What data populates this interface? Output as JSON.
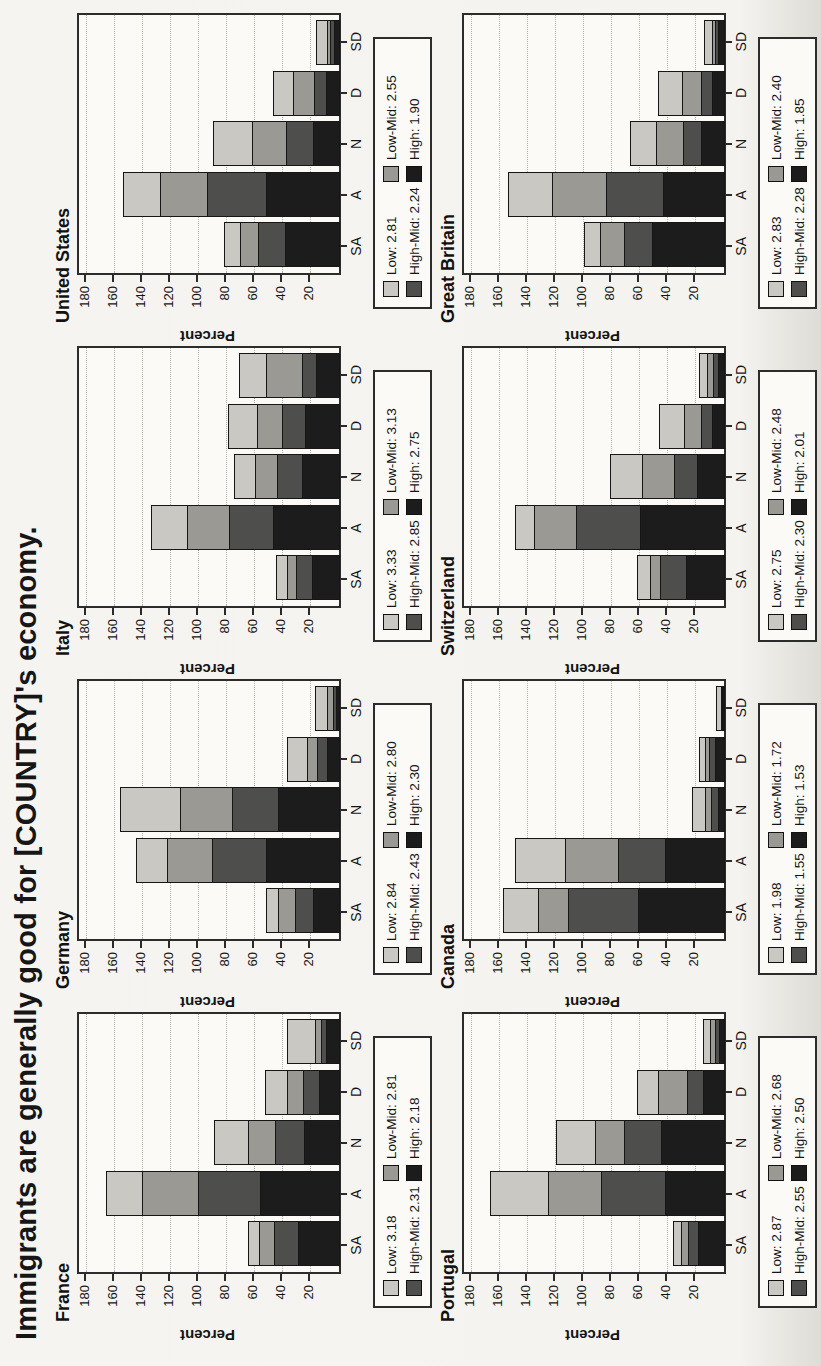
{
  "title": "Immigrants are generally good for [COUNTRY]'s economy.",
  "axis": {
    "ylabel": "Percent",
    "yticks": [
      20,
      40,
      60,
      80,
      100,
      120,
      140,
      160,
      180
    ],
    "ymax": 184,
    "categories": [
      "SA",
      "A",
      "N",
      "D",
      "SD"
    ]
  },
  "series_styles": [
    {
      "name": "Low",
      "color": "#c9c8c3"
    },
    {
      "name": "Low-Mid",
      "color": "#9a9994"
    },
    {
      "name": "High-Mid",
      "color": "#4e4e4c"
    },
    {
      "name": "High",
      "color": "#1c1c1c"
    }
  ],
  "chart_data": [
    {
      "type": "bar",
      "stacked": true,
      "title": "France",
      "categories": [
        "SA",
        "A",
        "N",
        "D",
        "SD"
      ],
      "ylabel": "Percent",
      "ylim": [
        0,
        184
      ],
      "grid": true,
      "legend_labels": [
        "Low: 3.18",
        "Low-Mid: 2.81",
        "High-Mid: 2.31",
        "High: 2.18"
      ],
      "legend_means": {
        "Low": 3.18,
        "Low-Mid": 2.81,
        "High-Mid": 2.31,
        "High": 2.18
      },
      "series": [
        {
          "name": "Low",
          "values": [
            9,
            26,
            25,
            17,
            21
          ]
        },
        {
          "name": "Low-Mid",
          "values": [
            11,
            41,
            20,
            12,
            5
          ]
        },
        {
          "name": "High-Mid",
          "values": [
            18,
            45,
            21,
            12,
            4
          ]
        },
        {
          "name": "High",
          "values": [
            30,
            57,
            26,
            15,
            10
          ]
        }
      ]
    },
    {
      "type": "bar",
      "stacked": true,
      "title": "Germany",
      "categories": [
        "SA",
        "A",
        "N",
        "D",
        "SD"
      ],
      "ylabel": "Percent",
      "ylim": [
        0,
        184
      ],
      "grid": true,
      "legend_labels": [
        "Low: 2.84",
        "Low-Mid: 2.80",
        "High-Mid: 2.43",
        "High: 2.30"
      ],
      "legend_means": {
        "Low": 2.84,
        "Low-Mid": 2.8,
        "High-Mid": 2.43,
        "High": 2.3
      },
      "series": [
        {
          "name": "Low",
          "values": [
            9,
            23,
            43,
            15,
            9
          ]
        },
        {
          "name": "Low-Mid",
          "values": [
            13,
            33,
            38,
            8,
            5
          ]
        },
        {
          "name": "High-Mid",
          "values": [
            14,
            39,
            34,
            8,
            3
          ]
        },
        {
          "name": "High",
          "values": [
            19,
            53,
            44,
            9,
            3
          ]
        }
      ]
    },
    {
      "type": "bar",
      "stacked": true,
      "title": "Italy",
      "categories": [
        "SA",
        "A",
        "N",
        "D",
        "SD"
      ],
      "ylabel": "Percent",
      "ylim": [
        0,
        184
      ],
      "grid": true,
      "legend_labels": [
        "Low: 3.33",
        "Low-Mid: 3.13",
        "High-Mid: 2.85",
        "High: 2.75"
      ],
      "legend_means": {
        "Low": 3.33,
        "Low-Mid": 3.13,
        "High-Mid": 2.85,
        "High": 2.75
      },
      "series": [
        {
          "name": "Low",
          "values": [
            9,
            26,
            16,
            21,
            20
          ]
        },
        {
          "name": "Low-Mid",
          "values": [
            7,
            31,
            16,
            19,
            26
          ]
        },
        {
          "name": "High-Mid",
          "values": [
            12,
            32,
            19,
            17,
            11
          ]
        },
        {
          "name": "High",
          "values": [
            20,
            48,
            27,
            25,
            17
          ]
        }
      ]
    },
    {
      "type": "bar",
      "stacked": true,
      "title": "United States",
      "categories": [
        "SA",
        "A",
        "N",
        "D",
        "SD"
      ],
      "ylabel": "Percent",
      "ylim": [
        0,
        184
      ],
      "grid": true,
      "legend_labels": [
        "Low: 2.81",
        "Low-Mid: 2.55",
        "High-Mid: 2.24",
        "High: 1.90"
      ],
      "legend_means": {
        "Low": 2.81,
        "Low-Mid": 2.55,
        "High-Mid": 2.24,
        "High": 1.9
      },
      "series": [
        {
          "name": "Low",
          "values": [
            12,
            27,
            29,
            15,
            8
          ]
        },
        {
          "name": "Low-Mid",
          "values": [
            14,
            34,
            25,
            16,
            3
          ]
        },
        {
          "name": "High-Mid",
          "values": [
            20,
            43,
            20,
            9,
            4
          ]
        },
        {
          "name": "High",
          "values": [
            39,
            53,
            19,
            10,
            4
          ]
        }
      ]
    },
    {
      "type": "bar",
      "stacked": true,
      "title": "Portugal",
      "categories": [
        "SA",
        "A",
        "N",
        "D",
        "SD"
      ],
      "ylabel": "Percent",
      "ylim": [
        0,
        184
      ],
      "grid": true,
      "legend_labels": [
        "Low: 2.87",
        "Low-Mid: 2.68",
        "High-Mid: 2.55",
        "High: 2.50"
      ],
      "legend_means": {
        "Low": 2.87,
        "Low-Mid": 2.68,
        "High-Mid": 2.55,
        "High": 2.5
      },
      "series": [
        {
          "name": "Low",
          "values": [
            6,
            42,
            29,
            16,
            6
          ]
        },
        {
          "name": "Low-Mid",
          "values": [
            6,
            39,
            21,
            21,
            4
          ]
        },
        {
          "name": "High-Mid",
          "values": [
            8,
            46,
            27,
            12,
            4
          ]
        },
        {
          "name": "High",
          "values": [
            19,
            43,
            46,
            16,
            4
          ]
        }
      ]
    },
    {
      "type": "bar",
      "stacked": true,
      "title": "Canada",
      "categories": [
        "SA",
        "A",
        "N",
        "D",
        "SD"
      ],
      "ylabel": "Percent",
      "ylim": [
        0,
        184
      ],
      "grid": true,
      "legend_labels": [
        "Low: 1.98",
        "Low-Mid: 1.72",
        "High-Mid: 1.55",
        "High: 1.53"
      ],
      "legend_means": {
        "Low": 1.98,
        "Low-Mid": 1.72,
        "High-Mid": 1.55,
        "High": 1.53
      },
      "series": [
        {
          "name": "Low",
          "values": [
            26,
            36,
            10,
            5,
            4
          ]
        },
        {
          "name": "Low-Mid",
          "values": [
            22,
            39,
            5,
            4,
            1
          ]
        },
        {
          "name": "High-Mid",
          "values": [
            51,
            34,
            6,
            5,
            1
          ]
        },
        {
          "name": "High",
          "values": [
            62,
            43,
            5,
            7,
            1
          ]
        }
      ]
    },
    {
      "type": "bar",
      "stacked": true,
      "title": "Switzerland",
      "categories": [
        "SA",
        "A",
        "N",
        "D",
        "SD"
      ],
      "ylabel": "Percent",
      "ylim": [
        0,
        184
      ],
      "grid": true,
      "legend_labels": [
        "Low: 2.75",
        "Low-Mid: 2.48",
        "High-Mid: 2.30",
        "High: 2.01"
      ],
      "legend_means": {
        "Low": 2.75,
        "Low-Mid": 2.48,
        "High-Mid": 2.3,
        "High": 2.01
      },
      "series": [
        {
          "name": "Low",
          "values": [
            10,
            14,
            23,
            18,
            7
          ]
        },
        {
          "name": "Low-Mid",
          "values": [
            8,
            31,
            24,
            13,
            5
          ]
        },
        {
          "name": "High-Mid",
          "values": [
            19,
            46,
            17,
            9,
            4
          ]
        },
        {
          "name": "High",
          "values": [
            28,
            61,
            20,
            9,
            5
          ]
        }
      ]
    },
    {
      "type": "bar",
      "stacked": true,
      "title": "Great Britain",
      "categories": [
        "SA",
        "A",
        "N",
        "D",
        "SD"
      ],
      "ylabel": "Percent",
      "ylim": [
        0,
        184
      ],
      "grid": true,
      "legend_labels": [
        "Low: 2.83",
        "Low-Mid: 2.40",
        "High-Mid: 2.28",
        "High: 1.85"
      ],
      "legend_means": {
        "Low": 2.83,
        "Low-Mid": 2.4,
        "High-Mid": 2.28,
        "High": 1.85
      },
      "series": [
        {
          "name": "Low",
          "values": [
            12,
            32,
            19,
            18,
            6
          ]
        },
        {
          "name": "Low-Mid",
          "values": [
            18,
            39,
            20,
            14,
            3
          ]
        },
        {
          "name": "High-Mid",
          "values": [
            21,
            42,
            14,
            9,
            3
          ]
        },
        {
          "name": "High",
          "values": [
            52,
            44,
            17,
            9,
            5
          ]
        }
      ]
    }
  ]
}
